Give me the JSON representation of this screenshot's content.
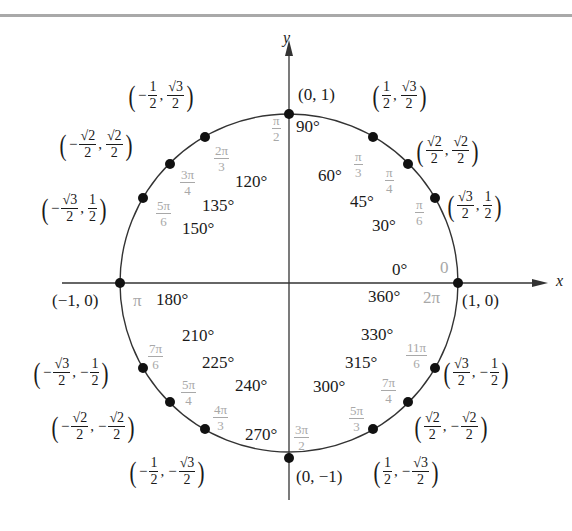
{
  "diagram": {
    "axes": {
      "x_label": "x",
      "y_label": "y"
    },
    "colors": {
      "line": "#333333",
      "dot": "#111111",
      "degree_text": "#1a1a1a",
      "radian_text": "#a8a8a8",
      "top_rule": "#a9a9a9"
    },
    "points": [
      {
        "deg": "0°",
        "rad": "0",
        "coord": "(1, 0)"
      },
      {
        "deg": "30°",
        "rad": "π/6",
        "coord": "(√3/2, 1/2)"
      },
      {
        "deg": "45°",
        "rad": "π/4",
        "coord": "(√2/2, √2/2)"
      },
      {
        "deg": "60°",
        "rad": "π/3",
        "coord": "(1/2, √3/2)"
      },
      {
        "deg": "90°",
        "rad": "π/2",
        "coord": "(0, 1)"
      },
      {
        "deg": "120°",
        "rad": "2π/3",
        "coord": "(−1/2, √3/2)"
      },
      {
        "deg": "135°",
        "rad": "3π/4",
        "coord": "(−√2/2, √2/2)"
      },
      {
        "deg": "150°",
        "rad": "5π/6",
        "coord": "(−√3/2, 1/2)"
      },
      {
        "deg": "180°",
        "rad": "π",
        "coord": "(−1, 0)"
      },
      {
        "deg": "210°",
        "rad": "7π/6",
        "coord": "(−√3/2, −1/2)"
      },
      {
        "deg": "225°",
        "rad": "5π/4",
        "coord": "(−√2/2, −√2/2)"
      },
      {
        "deg": "240°",
        "rad": "4π/3",
        "coord": "(−1/2, −√3/2)"
      },
      {
        "deg": "270°",
        "rad": "3π/2",
        "coord": "(0, −1)"
      },
      {
        "deg": "300°",
        "rad": "5π/3",
        "coord": "(1/2, −√3/2)"
      },
      {
        "deg": "315°",
        "rad": "7π/4",
        "coord": "(√2/2, −√2/2)"
      },
      {
        "deg": "330°",
        "rad": "11π/6",
        "coord": "(√3/2, −1/2)"
      },
      {
        "deg": "360°",
        "rad": "2π",
        "coord": "(1, 0)"
      }
    ],
    "text": {
      "d0": "0°",
      "d30": "30°",
      "d45": "45°",
      "d60": "60°",
      "d90": "90°",
      "d120": "120°",
      "d135": "135°",
      "d150": "150°",
      "d180": "180°",
      "d210": "210°",
      "d225": "225°",
      "d240": "240°",
      "d270": "270°",
      "d300": "300°",
      "d315": "315°",
      "d330": "330°",
      "d360": "360°",
      "pi": "π",
      "zero": "0",
      "twopi": "2π",
      "one": "1",
      "two": "2",
      "three": "3",
      "four": "4",
      "six": "6",
      "pi_n": "π",
      "twopi_n": "2π",
      "threepi_n": "3π",
      "fourpi_n": "4π",
      "fivepi_n": "5π",
      "sevenpi_n": "7π",
      "elevenpi_n": "11π",
      "sqrt2": "√2",
      "sqrt3": "√3",
      "minus": "−",
      "comma": ",",
      "lparen": "(",
      "rparen": ")",
      "c_0_1": "(0, 1)",
      "c_0_m1": "(0, −1)",
      "c_1_0": "(1, 0)",
      "c_m1_0": "(−1, 0)"
    }
  }
}
